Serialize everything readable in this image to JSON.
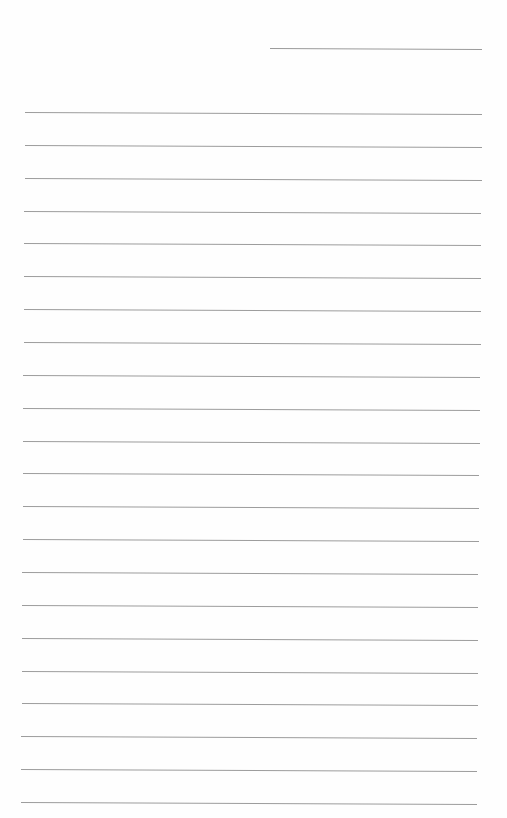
{
  "page": {
    "type": "lined-paper",
    "background": "#fefefe",
    "line_color": "#9c9c9c",
    "header_line": {
      "x": 270,
      "y": 48,
      "width": 212
    },
    "ruled_lines": {
      "count": 22,
      "first_y": 112,
      "spacing": 32.86,
      "left_start": 25,
      "left_end": 21,
      "right_start": 482,
      "right_end": 477
    },
    "text": ""
  }
}
